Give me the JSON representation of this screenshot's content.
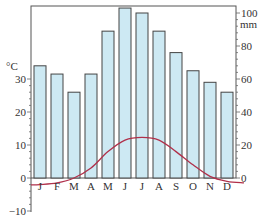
{
  "chart_data": {
    "type": "bar+line",
    "title": "",
    "categories": [
      "J",
      "F",
      "M",
      "A",
      "M",
      "J",
      "J",
      "A",
      "S",
      "O",
      "N",
      "D"
    ],
    "series": [
      {
        "name": "Precipitation",
        "kind": "bar",
        "axis": "right",
        "unit": "mm",
        "color": "#cde9f3",
        "values": [
          68,
          63,
          52,
          63,
          89,
          103,
          100,
          89,
          76,
          65,
          58,
          52
        ]
      },
      {
        "name": "Temperature",
        "kind": "line",
        "axis": "left",
        "unit": "°C",
        "color": "#b0304a",
        "values": [
          -2,
          -1.5,
          0,
          3,
          8,
          11.5,
          12.3,
          11.5,
          8,
          4,
          0.5,
          -1
        ]
      }
    ],
    "left_axis": {
      "label": "°C",
      "ticks": [
        30,
        20,
        10,
        0,
        -10
      ],
      "range": [
        -10,
        30
      ]
    },
    "right_axis": {
      "label": "mm",
      "ticks": [
        100,
        80,
        60,
        40,
        20,
        0
      ],
      "range": [
        0,
        100
      ]
    },
    "grid": false,
    "legend": "none"
  },
  "axis_labels": {
    "left_unit": "°C",
    "right_unit": "mm"
  }
}
